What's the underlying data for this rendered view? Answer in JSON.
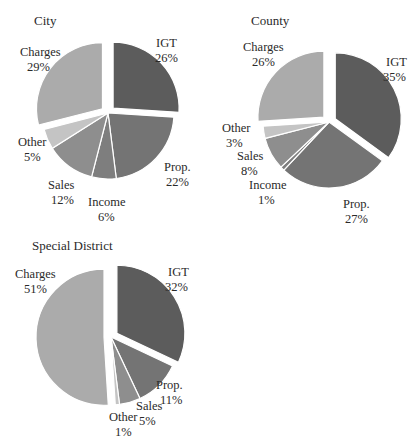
{
  "chart_data": [
    {
      "type": "pie",
      "title": "City",
      "categories": [
        "IGT",
        "Prop.",
        "Income",
        "Sales",
        "Other",
        "Charges"
      ],
      "values": [
        26,
        22,
        6,
        12,
        5,
        29
      ],
      "labels": [
        "26%",
        "22%",
        "6%",
        "12%",
        "5%",
        "29%"
      ],
      "exploded": [
        "IGT",
        "Charges"
      ],
      "colors": [
        "#5c5c5c",
        "#747474",
        "#7e7e7e",
        "#8e8e8e",
        "#c4c4c4",
        "#ababab"
      ]
    },
    {
      "type": "pie",
      "title": "County",
      "categories": [
        "IGT",
        "Prop.",
        "Income",
        "Sales",
        "Other",
        "Charges"
      ],
      "values": [
        35,
        27,
        1,
        8,
        3,
        26
      ],
      "labels": [
        "35%",
        "27%",
        "1%",
        "8%",
        "3%",
        "26%"
      ],
      "exploded": [
        "IGT",
        "Charges"
      ],
      "colors": [
        "#5c5c5c",
        "#747474",
        "#7e7e7e",
        "#8e8e8e",
        "#c4c4c4",
        "#ababab"
      ]
    },
    {
      "type": "pie",
      "title": "Special District",
      "categories": [
        "IGT",
        "Prop.",
        "Sales",
        "Other",
        "Charges"
      ],
      "values": [
        32,
        11,
        5,
        1,
        51
      ],
      "labels": [
        "32%",
        "11%",
        "5%",
        "1%",
        "51%"
      ],
      "exploded": [
        "IGT",
        "Charges"
      ],
      "colors": [
        "#5c5c5c",
        "#747474",
        "#8e8e8e",
        "#c4c4c4",
        "#ababab"
      ]
    }
  ],
  "charts": {
    "city": {
      "title": "City",
      "labels": {
        "igt": {
          "name": "IGT",
          "pct": "26%"
        },
        "prop": {
          "name": "Prop.",
          "pct": "22%"
        },
        "income": {
          "name": "Income",
          "pct": "6%"
        },
        "sales": {
          "name": "Sales",
          "pct": "12%"
        },
        "other": {
          "name": "Other",
          "pct": "5%"
        },
        "charges": {
          "name": "Charges",
          "pct": "29%"
        }
      }
    },
    "county": {
      "title": "County",
      "labels": {
        "igt": {
          "name": "IGT",
          "pct": "35%"
        },
        "prop": {
          "name": "Prop.",
          "pct": "27%"
        },
        "income": {
          "name": "Income",
          "pct": "1%"
        },
        "sales": {
          "name": "Sales",
          "pct": "8%"
        },
        "other": {
          "name": "Other",
          "pct": "3%"
        },
        "charges": {
          "name": "Charges",
          "pct": "26%"
        }
      }
    },
    "special": {
      "title": "Special District",
      "labels": {
        "igt": {
          "name": "IGT",
          "pct": "32%"
        },
        "prop": {
          "name": "Prop.",
          "pct": "11%"
        },
        "sales": {
          "name": "Sales",
          "pct": "5%"
        },
        "other": {
          "name": "Other",
          "pct": "1%"
        },
        "charges": {
          "name": "Charges",
          "pct": "51%"
        }
      }
    }
  }
}
